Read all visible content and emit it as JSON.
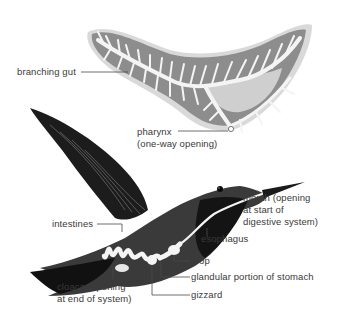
{
  "diagram": {
    "subject_top": "flatworm branching gut",
    "subject_bottom": "hummingbird digestive system",
    "colors": {
      "background": "#ffffff",
      "label_text": "#3a3a3a",
      "leader_line": "#4a4a4a",
      "gut_fill": "#f2f2f2",
      "worm_shadow": "#bdbdbd",
      "bird_body": "#3c3c3c",
      "bird_dark": "#161616",
      "digestive_tract": "#f4f4f4"
    },
    "top_labels": {
      "branching_gut": "branching gut",
      "pharynx_line1": "pharynx",
      "pharynx_line2": "(one-way opening)"
    },
    "bird_labels": {
      "mouth_line1": "mouth (opening",
      "mouth_line2": "at start of",
      "mouth_line3": "digestive system)",
      "esophagus": "esophagus",
      "intestines": "intestines",
      "crop": "crop",
      "glandular_stomach": "glandular portion of stomach",
      "cloaca_line1": "cloaca (opening",
      "cloaca_line2": "at end of system)",
      "gizzard": "gizzard"
    }
  }
}
